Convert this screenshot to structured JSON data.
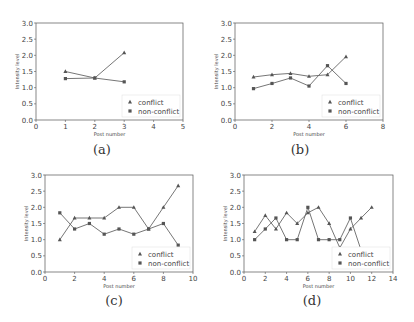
{
  "chart_data": [
    {
      "type": "line",
      "caption": "(a)",
      "xlabel": "Post number",
      "ylabel": "Intensity level",
      "xlim": [
        0,
        5
      ],
      "ylim": [
        0,
        3.0
      ],
      "xticks": [
        0,
        1,
        2,
        3,
        4,
        5
      ],
      "yticks": [
        0.0,
        0.5,
        1.0,
        1.5,
        2.0,
        2.5,
        3.0
      ],
      "legend_position": "lower right",
      "x": [
        1,
        2,
        3
      ],
      "series": [
        {
          "name": "conflict",
          "marker": "triangle",
          "values": [
            1.5,
            1.3,
            2.08
          ]
        },
        {
          "name": "non-conflict",
          "marker": "square",
          "values": [
            1.28,
            1.3,
            1.18
          ]
        }
      ]
    },
    {
      "type": "line",
      "caption": "(b)",
      "xlabel": "Post number",
      "ylabel": "Intensity level",
      "xlim": [
        0,
        8
      ],
      "ylim": [
        0,
        3.0
      ],
      "xticks": [
        0,
        2,
        4,
        6,
        8
      ],
      "yticks": [
        0.0,
        0.5,
        1.0,
        1.5,
        2.0,
        2.5,
        3.0
      ],
      "legend_position": "lower right",
      "x": [
        1,
        2,
        3,
        4,
        5,
        6
      ],
      "series": [
        {
          "name": "conflict",
          "marker": "triangle",
          "values": [
            1.33,
            1.4,
            1.44,
            1.35,
            1.4,
            1.96
          ]
        },
        {
          "name": "non-conflict",
          "marker": "square",
          "values": [
            0.97,
            1.13,
            1.3,
            1.05,
            1.68,
            1.13
          ]
        }
      ]
    },
    {
      "type": "line",
      "caption": "(c)",
      "xlabel": "Post number",
      "ylabel": "Intensity level",
      "xlim": [
        0,
        10
      ],
      "ylim": [
        0,
        3.0
      ],
      "xticks": [
        0,
        2,
        4,
        6,
        8,
        10
      ],
      "yticks": [
        0.0,
        0.5,
        1.0,
        1.5,
        2.0,
        2.5,
        3.0
      ],
      "legend_position": "lower right",
      "x": [
        1,
        2,
        3,
        4,
        5,
        6,
        7,
        8,
        9
      ],
      "series": [
        {
          "name": "conflict",
          "marker": "triangle",
          "values": [
            1.0,
            1.67,
            1.67,
            1.67,
            2.0,
            2.0,
            1.33,
            2.0,
            2.67
          ]
        },
        {
          "name": "non-conflict",
          "marker": "square",
          "values": [
            1.83,
            1.33,
            1.5,
            1.17,
            1.33,
            1.17,
            1.33,
            1.5,
            0.83
          ]
        }
      ]
    },
    {
      "type": "line",
      "caption": "(d)",
      "xlabel": "Post number",
      "ylabel": "Intensity level",
      "xlim": [
        0,
        14
      ],
      "ylim": [
        0,
        3.0
      ],
      "xticks": [
        0,
        2,
        4,
        6,
        8,
        10,
        12,
        14
      ],
      "yticks": [
        0.0,
        0.5,
        1.0,
        1.5,
        2.0,
        2.5,
        3.0
      ],
      "legend_position": "lower right",
      "x": [
        1,
        2,
        3,
        4,
        5,
        6,
        7,
        8,
        9,
        10,
        11,
        12
      ],
      "series": [
        {
          "name": "conflict",
          "marker": "triangle",
          "values": [
            1.25,
            1.75,
            1.33,
            1.83,
            1.5,
            1.83,
            2.0,
            1.5,
            0.75,
            1.33,
            1.67,
            2.0
          ]
        },
        {
          "name": "non-conflict",
          "marker": "square",
          "values": [
            1.0,
            1.33,
            1.67,
            1.0,
            1.0,
            2.0,
            1.0,
            1.0,
            1.0,
            1.67,
            0.67,
            0.67
          ]
        }
      ]
    }
  ],
  "layout": {
    "panels": [
      {
        "left": 36,
        "right": 183,
        "top": 23,
        "bottom": 120,
        "caption_x": 82,
        "caption_y": 142
      },
      {
        "left": 235,
        "right": 383,
        "top": 23,
        "bottom": 120,
        "caption_x": 280,
        "caption_y": 142
      },
      {
        "left": 45,
        "right": 193,
        "top": 175,
        "bottom": 272,
        "caption_x": 94,
        "caption_y": 293
      },
      {
        "left": 244,
        "right": 393,
        "top": 175,
        "bottom": 272,
        "caption_x": 292,
        "caption_y": 293
      }
    ],
    "colors": {
      "axis": "#555555",
      "line": "#666666",
      "marker": "#555555",
      "text": "#444444"
    }
  }
}
